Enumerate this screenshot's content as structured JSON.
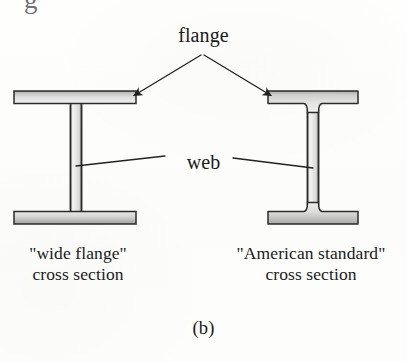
{
  "figure": {
    "letter": "(b)",
    "cropped_top_glyph": "g",
    "annotations": {
      "flange_label": "flange",
      "web_label": "web"
    },
    "captions": {
      "left": {
        "line1": "\"wide flange\"",
        "line2": "cross section"
      },
      "right": {
        "line1": "\"American standard\"",
        "line2": "cross section"
      }
    },
    "colors": {
      "background": "#fdfdfc",
      "ink": "#1a1a1a",
      "outline": "#2b2b2b",
      "steel_light": "#efefee",
      "steel_mid": "#d8d8d6",
      "steel_dark": "#9a9a98"
    },
    "shapes": {
      "left_beam": {
        "name": "wide flange",
        "designation": "W-shape",
        "flange_profile": "parallel",
        "top_flange": {
          "x1": 14,
          "x2": 136,
          "y1": 91,
          "y2": 103
        },
        "bottom_flange": {
          "x1": 14,
          "x2": 136,
          "y1": 212,
          "y2": 224
        },
        "web": {
          "center_x": 76,
          "width": 11,
          "y1": 103,
          "y2": 212
        }
      },
      "right_beam": {
        "name": "American standard",
        "designation": "S-shape",
        "flange_profile": "tapered",
        "top_flange": {
          "x1": 268,
          "x2": 358,
          "y_top": 91,
          "y_outer": 103,
          "y_inner": 113
        },
        "bottom_flange": {
          "x1": 268,
          "x2": 358,
          "y_bottom": 224,
          "y_outer": 212,
          "y_inner": 202
        },
        "web": {
          "center_x": 313,
          "width": 11,
          "y1": 113,
          "y2": 202
        }
      }
    },
    "leaders": {
      "flange_apex": {
        "x": 202,
        "y": 55
      },
      "flange_target_left": {
        "x": 131,
        "y": 97
      },
      "flange_target_right": {
        "x": 273,
        "y": 97
      },
      "web_target_left": {
        "x": 76,
        "y": 166
      },
      "web_target_right": {
        "x": 313,
        "y": 168
      }
    }
  }
}
